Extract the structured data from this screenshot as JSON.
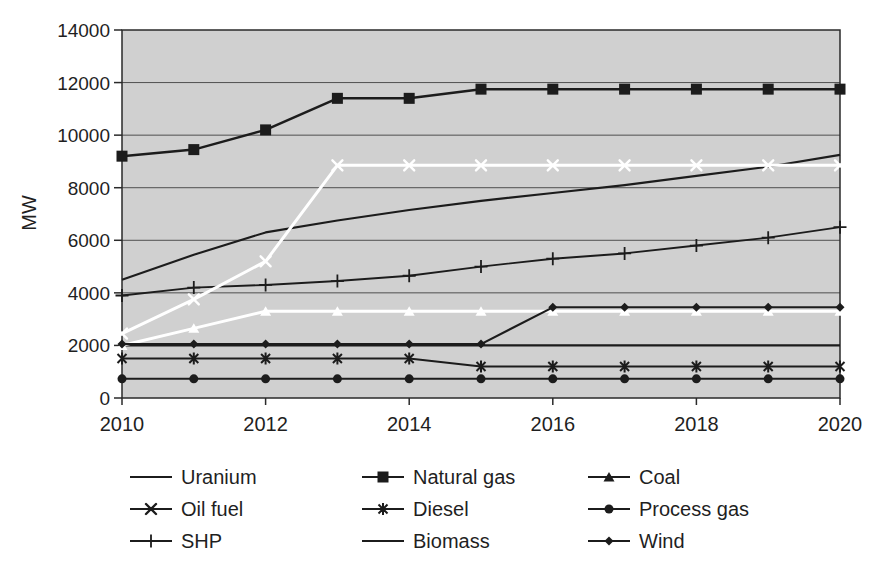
{
  "figure": {
    "kind": "scanned line chart, grey plot panel, legend below"
  },
  "colors": {
    "page_bg": "#ffffff",
    "plot_bg": "#d0d0d0",
    "grid_line": "#4f4f4f",
    "frame": "#2a2a2a",
    "black_series": "#1c1c1c",
    "white_series": "#ffffff",
    "text": "#1f1f1f"
  },
  "chart_data": {
    "type": "line",
    "title": "",
    "xlabel": "",
    "ylabel": "MW",
    "ylim": [
      0,
      14000
    ],
    "ytick_step": 2000,
    "ytick_labels": [
      "0",
      "2000",
      "4000",
      "6000",
      "8000",
      "10000",
      "12000",
      "14000"
    ],
    "xlim": [
      2010,
      2020
    ],
    "xticks": [
      2010,
      2012,
      2014,
      2016,
      2018,
      2020
    ],
    "xtick_labels": [
      "2010",
      "2012",
      "2014",
      "2016",
      "2018",
      "2020"
    ],
    "x": [
      2010,
      2011,
      2012,
      2013,
      2014,
      2015,
      2016,
      2017,
      2018,
      2019,
      2020
    ],
    "grid": "horizontal",
    "legend_position": "bottom",
    "legend_marker_color": "#1c1c1c",
    "series": [
      {
        "name": "Uranium",
        "marker": "none",
        "color": "#1c1c1c",
        "width": 2.1,
        "values": [
          4500,
          5450,
          6300,
          6750,
          7150,
          7500,
          7800,
          8100,
          8450,
          8800,
          9250
        ]
      },
      {
        "name": "Natural gas",
        "marker": "square",
        "color": "#1c1c1c",
        "width": 2.5,
        "values": [
          9200,
          9450,
          10200,
          11400,
          11400,
          11750,
          11750,
          11750,
          11750,
          11750,
          11750
        ]
      },
      {
        "name": "Coal",
        "marker": "triangle",
        "color": "#ffffff",
        "width": 3,
        "values": [
          2000,
          2650,
          3300,
          3300,
          3300,
          3300,
          3300,
          3300,
          3300,
          3300,
          3300
        ]
      },
      {
        "name": "Oil fuel",
        "marker": "x",
        "color": "#ffffff",
        "width": 3,
        "values": [
          2450,
          3750,
          5200,
          8850,
          8850,
          8850,
          8850,
          8850,
          8850,
          8850,
          8850
        ]
      },
      {
        "name": "Diesel",
        "marker": "star",
        "color": "#1c1c1c",
        "width": 2.1,
        "values": [
          1500,
          1500,
          1500,
          1500,
          1500,
          1200,
          1200,
          1200,
          1200,
          1200,
          1200
        ]
      },
      {
        "name": "Process gas",
        "marker": "circle",
        "color": "#1c1c1c",
        "width": 2.1,
        "values": [
          730,
          730,
          730,
          730,
          730,
          730,
          730,
          730,
          730,
          730,
          730
        ]
      },
      {
        "name": "SHP",
        "marker": "plus",
        "color": "#1c1c1c",
        "width": 1.9,
        "values": [
          3900,
          4200,
          4300,
          4450,
          4650,
          5000,
          5300,
          5500,
          5800,
          6100,
          6500
        ]
      },
      {
        "name": "Biomass",
        "marker": "none",
        "color": "#1c1c1c",
        "width": 2.3,
        "values": [
          2000,
          2000,
          2000,
          2000,
          2000,
          2000,
          2000,
          2000,
          2000,
          2000,
          2000
        ]
      },
      {
        "name": "Wind",
        "marker": "diamond",
        "color": "#1c1c1c",
        "width": 2.1,
        "values": [
          2050,
          2050,
          2050,
          2050,
          2050,
          2050,
          3450,
          3450,
          3450,
          3450,
          3450
        ]
      }
    ],
    "draw_order": [
      "Uranium",
      "Natural gas",
      "Diesel",
      "Process gas",
      "SHP",
      "Biomass",
      "Coal",
      "Oil fuel",
      "Wind"
    ],
    "legend_columns": [
      [
        "Uranium",
        "Oil fuel",
        "SHP"
      ],
      [
        "Natural gas",
        "Diesel",
        "Biomass"
      ],
      [
        "Coal",
        "Process gas",
        "Wind"
      ]
    ]
  }
}
